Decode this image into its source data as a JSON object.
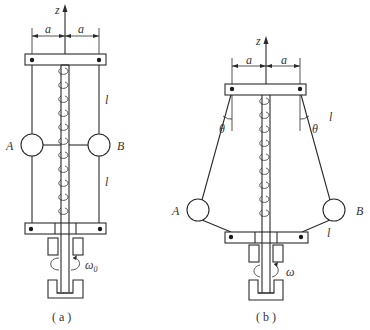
{
  "figure_a": {
    "caption": "( a )",
    "axis_label": "z",
    "dim_left": "a",
    "dim_right": "a",
    "ball_left": "A",
    "ball_right": "B",
    "length_upper": "l",
    "length_lower": "l",
    "omega": "ω",
    "omega_sub": "0"
  },
  "figure_b": {
    "caption": "( b )",
    "axis_label": "z",
    "dim_left": "a",
    "dim_right": "a",
    "angle_left": "θ",
    "angle_right": "θ",
    "ball_left": "A",
    "ball_right": "B",
    "length_upper": "l",
    "length_lower": "l",
    "omega": "ω"
  },
  "colors": {
    "line": "#2a2a2a",
    "text": "#333333",
    "background": "#ffffff"
  }
}
